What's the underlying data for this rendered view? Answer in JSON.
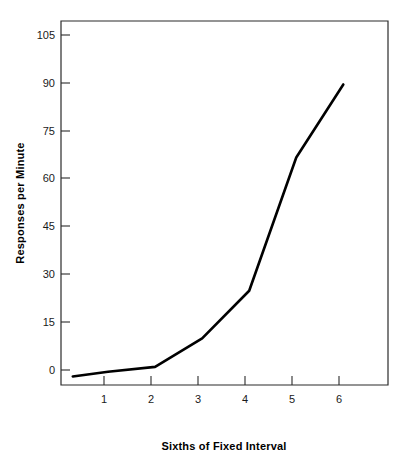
{
  "chart_data": {
    "type": "line",
    "title": "",
    "subtitle": "",
    "xlabel": "Sixths of Fixed Interval",
    "ylabel": "Responses per Minute",
    "x": [
      0.25,
      1,
      2,
      3,
      4,
      5,
      6
    ],
    "values": [
      -2,
      -0.5,
      1,
      10,
      25,
      67,
      90
    ],
    "series": [
      {
        "name": "Responses per Minute",
        "x": [
          0.25,
          1,
          2,
          3,
          4,
          5,
          6
        ],
        "values": [
          -2,
          -0.5,
          1,
          10,
          25,
          67,
          90
        ],
        "color": "#000000"
      }
    ],
    "x_tick_labels": [
      "1",
      "2",
      "3",
      "4",
      "5",
      "6"
    ],
    "x_tick_values": [
      1,
      2,
      3,
      4,
      5,
      6
    ],
    "y_tick_labels": [
      "0",
      "15",
      "30",
      "45",
      "60",
      "75",
      "90",
      "105"
    ],
    "y_tick_values": [
      0,
      15,
      30,
      45,
      60,
      75,
      90,
      105
    ],
    "xlim": [
      0,
      6.95
    ],
    "ylim": [
      -4.7,
      110
    ],
    "grid": false,
    "legend": null,
    "legend_position": "none",
    "frame": "box",
    "line_color": "#000000",
    "background_color": "#ffffff",
    "axis_color": "#2b2b2b"
  }
}
